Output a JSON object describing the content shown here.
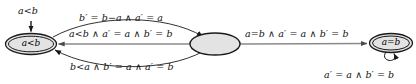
{
  "diagram": {
    "colors": {
      "stroke": "#1a1a1a",
      "edge_gray": "#8a8a8a",
      "node_fill": "#e3e3e3",
      "text": "#111111",
      "background": "#ffffff"
    },
    "states": [
      {
        "id": "state-a-lt-b",
        "label": "a<b",
        "shape": "double-ellipse",
        "accepting": true,
        "cx": 31,
        "cy": 44,
        "rx": 25,
        "ry": 10
      },
      {
        "id": "state-middle",
        "label": "",
        "shape": "ellipse",
        "accepting": false,
        "cx": 215,
        "cy": 44,
        "rx": 25,
        "ry": 11
      },
      {
        "id": "state-a-eq-b",
        "label": "a=b",
        "shape": "double-ellipse",
        "accepting": true,
        "cx": 391,
        "cy": 43,
        "rx": 21,
        "ry": 9
      }
    ],
    "initial_arrow": {
      "label": "a<b",
      "from_state": "",
      "to_state": "state-a-lt-b"
    },
    "transitions": [
      {
        "id": "edge-top",
        "label": "b′ = b−a ∧ a′ = a",
        "from": "state-a-lt-b",
        "to": "state-middle",
        "style": "curve-up",
        "color": "dark"
      },
      {
        "id": "edge-middle",
        "label": "a<b ∧ a′ = a ∧ b′ = b",
        "from": "state-middle",
        "to": "state-a-lt-b",
        "style": "straight",
        "color": "gray"
      },
      {
        "id": "edge-bottom",
        "label": "b<a ∧ b′ = a ∧ a′ = b",
        "from": "state-middle",
        "to": "state-a-lt-b",
        "style": "curve-down",
        "color": "dark"
      },
      {
        "id": "edge-right",
        "label": "a=b ∧ a′ = a ∧ b′ = b",
        "from": "state-middle",
        "to": "state-a-eq-b",
        "style": "straight",
        "color": "gray"
      },
      {
        "id": "edge-self-loop",
        "label": "a′ = a ∧ b′ = b",
        "from": "state-a-eq-b",
        "to": "state-a-eq-b",
        "style": "self-loop",
        "color": "dark"
      }
    ]
  }
}
